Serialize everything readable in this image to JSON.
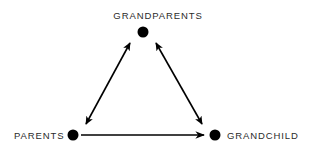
{
  "diagram": {
    "background_color": "#ffffff",
    "stroke_color": "#000000",
    "label_color": "#2b2b2b",
    "nodes": [
      {
        "id": "grandparents",
        "label": "GRANDPARENTS",
        "x": 143,
        "y": 32,
        "radius": 5.5,
        "label_position": "above"
      },
      {
        "id": "parents",
        "label": "PARENTS",
        "x": 73,
        "y": 135,
        "radius": 5.5,
        "label_position": "left"
      },
      {
        "id": "grandchild",
        "label": "GRANDCHILD",
        "x": 215,
        "y": 135,
        "radius": 5.5,
        "label_position": "right"
      }
    ],
    "edges": [
      {
        "id": "parents-grandparents",
        "from": "parents",
        "to": "grandparents",
        "direction": "bidirectional",
        "style": "solid"
      },
      {
        "id": "grandparents-grandchild",
        "from": "grandparents",
        "to": "grandchild",
        "direction": "bidirectional",
        "style": "solid"
      },
      {
        "id": "parents-grandchild",
        "from": "parents",
        "to": "grandchild",
        "direction": "forward",
        "style": "solid"
      }
    ]
  }
}
